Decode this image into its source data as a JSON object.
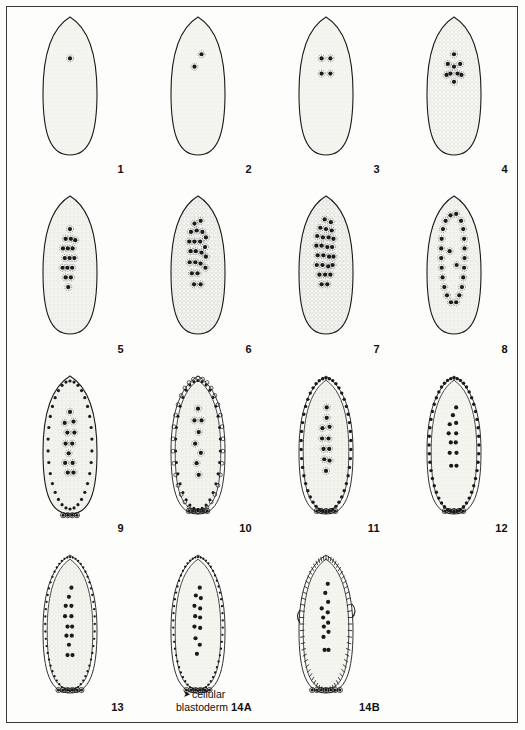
{
  "figure": {
    "type": "scientific-plate",
    "columns": 4,
    "rows": 4,
    "ink_color": "#1a1a1a",
    "cytoplasm_color": "#f7f7f2",
    "background_color": "#fdfdfb"
  },
  "annotation": {
    "arrow_glyph": "➤",
    "line1": "cellular",
    "line2": "blastoderm"
  },
  "panels": [
    {
      "label": "1",
      "stage": "zygote-one-nucleus",
      "nuclei": 1,
      "nuclei_points": [
        [
          0.5,
          0.3
        ]
      ],
      "periphery": "none",
      "pole_cells": 0,
      "membrane_style": "smooth",
      "stipple": "light",
      "halo": true
    },
    {
      "label": "2",
      "stage": "two-nuclei",
      "nuclei": 2,
      "nuclei_points": [
        [
          0.58,
          0.27
        ],
        [
          0.42,
          0.36
        ]
      ],
      "periphery": "none",
      "pole_cells": 0,
      "membrane_style": "smooth",
      "stipple": "light",
      "halo": true
    },
    {
      "label": "3",
      "stage": "four-nuclei",
      "nuclei": 4,
      "nuclei_points": [
        [
          0.4,
          0.3
        ],
        [
          0.6,
          0.3
        ],
        [
          0.4,
          0.41
        ],
        [
          0.6,
          0.41
        ]
      ],
      "periphery": "none",
      "pole_cells": 0,
      "membrane_style": "smooth",
      "stipple": "light",
      "halo": true
    },
    {
      "label": "4",
      "stage": "eight-nuclei-cluster",
      "nuclei": 9,
      "nuclei_points": [
        [
          0.5,
          0.27
        ],
        [
          0.36,
          0.34
        ],
        [
          0.64,
          0.34
        ],
        [
          0.5,
          0.36
        ],
        [
          0.33,
          0.42
        ],
        [
          0.42,
          0.41
        ],
        [
          0.58,
          0.41
        ],
        [
          0.67,
          0.42
        ],
        [
          0.5,
          0.47
        ]
      ],
      "periphery": "none",
      "pole_cells": 0,
      "membrane_style": "smooth",
      "stipple": "medium",
      "halo": true
    },
    {
      "label": "5",
      "stage": "syncytial-cleavage-central",
      "nuclei": 16,
      "nuclei_points": [
        [
          0.5,
          0.24
        ],
        [
          0.4,
          0.31
        ],
        [
          0.52,
          0.31
        ],
        [
          0.62,
          0.32
        ],
        [
          0.34,
          0.38
        ],
        [
          0.45,
          0.38
        ],
        [
          0.56,
          0.38
        ],
        [
          0.38,
          0.45
        ],
        [
          0.49,
          0.45
        ],
        [
          0.6,
          0.45
        ],
        [
          0.33,
          0.52
        ],
        [
          0.44,
          0.52
        ],
        [
          0.55,
          0.52
        ],
        [
          0.4,
          0.59
        ],
        [
          0.52,
          0.59
        ],
        [
          0.46,
          0.66
        ]
      ],
      "periphery": "none",
      "pole_cells": 0,
      "membrane_style": "smooth",
      "stipple": "medium",
      "halo": true
    },
    {
      "label": "6",
      "stage": "syncytial-cleavage-expanding",
      "nuclei": 22,
      "nuclei_points": [
        [
          0.42,
          0.2
        ],
        [
          0.56,
          0.18
        ],
        [
          0.34,
          0.26
        ],
        [
          0.47,
          0.25
        ],
        [
          0.6,
          0.26
        ],
        [
          0.68,
          0.3
        ],
        [
          0.3,
          0.33
        ],
        [
          0.42,
          0.33
        ],
        [
          0.55,
          0.33
        ],
        [
          0.66,
          0.37
        ],
        [
          0.33,
          0.4
        ],
        [
          0.45,
          0.4
        ],
        [
          0.58,
          0.41
        ],
        [
          0.68,
          0.44
        ],
        [
          0.31,
          0.48
        ],
        [
          0.44,
          0.48
        ],
        [
          0.56,
          0.49
        ],
        [
          0.67,
          0.52
        ],
        [
          0.36,
          0.56
        ],
        [
          0.49,
          0.56
        ],
        [
          0.41,
          0.64
        ],
        [
          0.56,
          0.64
        ]
      ],
      "periphery": "none",
      "pole_cells": 0,
      "membrane_style": "smooth",
      "stipple": "heavy",
      "halo": true
    },
    {
      "label": "7",
      "stage": "syncytial-cleavage-dense",
      "nuclei": 26,
      "nuclei_points": [
        [
          0.47,
          0.17
        ],
        [
          0.61,
          0.19
        ],
        [
          0.37,
          0.23
        ],
        [
          0.5,
          0.24
        ],
        [
          0.63,
          0.25
        ],
        [
          0.3,
          0.29
        ],
        [
          0.43,
          0.3
        ],
        [
          0.56,
          0.3
        ],
        [
          0.67,
          0.31
        ],
        [
          0.28,
          0.36
        ],
        [
          0.4,
          0.36
        ],
        [
          0.53,
          0.37
        ],
        [
          0.64,
          0.37
        ],
        [
          0.31,
          0.43
        ],
        [
          0.44,
          0.43
        ],
        [
          0.57,
          0.44
        ],
        [
          0.67,
          0.44
        ],
        [
          0.29,
          0.5
        ],
        [
          0.42,
          0.5
        ],
        [
          0.55,
          0.51
        ],
        [
          0.65,
          0.5
        ],
        [
          0.35,
          0.57
        ],
        [
          0.48,
          0.57
        ],
        [
          0.6,
          0.57
        ],
        [
          0.4,
          0.64
        ],
        [
          0.53,
          0.64
        ]
      ],
      "periphery": "none",
      "pole_cells": 0,
      "membrane_style": "smooth",
      "stipple": "heavy",
      "halo": true
    },
    {
      "label": "8",
      "stage": "nuclear-migration-to-cortex",
      "nuclei": 24,
      "nuclei_points": [
        [
          0.42,
          0.14
        ],
        [
          0.55,
          0.13
        ],
        [
          0.31,
          0.18
        ],
        [
          0.66,
          0.18
        ],
        [
          0.25,
          0.24
        ],
        [
          0.71,
          0.24
        ],
        [
          0.22,
          0.31
        ],
        [
          0.73,
          0.31
        ],
        [
          0.21,
          0.38
        ],
        [
          0.74,
          0.38
        ],
        [
          0.21,
          0.45
        ],
        [
          0.74,
          0.45
        ],
        [
          0.22,
          0.52
        ],
        [
          0.73,
          0.52
        ],
        [
          0.24,
          0.59
        ],
        [
          0.71,
          0.59
        ],
        [
          0.28,
          0.66
        ],
        [
          0.68,
          0.66
        ],
        [
          0.34,
          0.72
        ],
        [
          0.62,
          0.72
        ],
        [
          0.43,
          0.77
        ],
        [
          0.55,
          0.77
        ],
        [
          0.4,
          0.4
        ],
        [
          0.56,
          0.5
        ]
      ],
      "periphery": "none",
      "pole_cells": 0,
      "membrane_style": "smooth",
      "stipple": "medium",
      "halo": true
    },
    {
      "label": "9",
      "stage": "syncytial-blastoderm-pole-buds",
      "nuclei": 12,
      "nuclei_points": [
        [
          0.5,
          0.26
        ],
        [
          0.38,
          0.34
        ],
        [
          0.58,
          0.33
        ],
        [
          0.44,
          0.41
        ],
        [
          0.6,
          0.41
        ],
        [
          0.4,
          0.49
        ],
        [
          0.55,
          0.49
        ],
        [
          0.47,
          0.56
        ],
        [
          0.39,
          0.63
        ],
        [
          0.56,
          0.63
        ],
        [
          0.45,
          0.7
        ],
        [
          0.58,
          0.7
        ]
      ],
      "periphery": "dots-inner",
      "periphery_count": 34,
      "pole_cells": 4,
      "membrane_style": "smooth",
      "stipple": "medium",
      "halo": true
    },
    {
      "label": "10",
      "stage": "syncytial-blastoderm-scalloped",
      "nuclei": 8,
      "nuclei_points": [
        [
          0.5,
          0.22
        ],
        [
          0.4,
          0.31
        ],
        [
          0.6,
          0.31
        ],
        [
          0.52,
          0.4
        ],
        [
          0.42,
          0.49
        ],
        [
          0.58,
          0.56
        ],
        [
          0.46,
          0.64
        ],
        [
          0.52,
          0.73
        ]
      ],
      "periphery": "scallop",
      "periphery_count": 34,
      "pole_cells": 5,
      "membrane_style": "scalloped",
      "stipple": "medium",
      "halo": true
    },
    {
      "label": "11",
      "stage": "cortical-nuclei-dense-ring",
      "nuclei": 11,
      "nuclei_points": [
        [
          0.52,
          0.21
        ],
        [
          0.52,
          0.29
        ],
        [
          0.4,
          0.37
        ],
        [
          0.6,
          0.36
        ],
        [
          0.39,
          0.45
        ],
        [
          0.57,
          0.45
        ],
        [
          0.43,
          0.53
        ],
        [
          0.59,
          0.53
        ],
        [
          0.45,
          0.61
        ],
        [
          0.6,
          0.62
        ],
        [
          0.5,
          0.7
        ]
      ],
      "periphery": "dots-dense",
      "periphery_count": 46,
      "pole_cells": 5,
      "membrane_style": "beaded",
      "stipple": "medium",
      "halo": true
    },
    {
      "label": "12",
      "stage": "cortical-nuclei-ring-yolk-nuclei",
      "nuclei": 12,
      "nuclei_points": [
        [
          0.56,
          0.21
        ],
        [
          0.47,
          0.27
        ],
        [
          0.38,
          0.34
        ],
        [
          0.56,
          0.33
        ],
        [
          0.35,
          0.41
        ],
        [
          0.56,
          0.41
        ],
        [
          0.41,
          0.48
        ],
        [
          0.55,
          0.48
        ],
        [
          0.38,
          0.56
        ],
        [
          0.57,
          0.56
        ],
        [
          0.42,
          0.66
        ],
        [
          0.57,
          0.66
        ]
      ],
      "periphery": "dots-dense",
      "periphery_count": 48,
      "pole_cells": 5,
      "membrane_style": "beaded",
      "stipple": "light",
      "halo": false
    },
    {
      "label": "13",
      "stage": "pre-cellularisation",
      "nuclei": 13,
      "nuclei_points": [
        [
          0.54,
          0.22
        ],
        [
          0.47,
          0.29
        ],
        [
          0.38,
          0.36
        ],
        [
          0.54,
          0.36
        ],
        [
          0.36,
          0.44
        ],
        [
          0.54,
          0.44
        ],
        [
          0.43,
          0.52
        ],
        [
          0.56,
          0.52
        ],
        [
          0.4,
          0.59
        ],
        [
          0.55,
          0.59
        ],
        [
          0.47,
          0.66
        ],
        [
          0.43,
          0.74
        ],
        [
          0.57,
          0.74
        ]
      ],
      "periphery": "dots-fine",
      "periphery_count": 56,
      "pole_cells": 6,
      "membrane_style": "beaded",
      "stipple": "medium",
      "halo": false
    },
    {
      "label": "14A",
      "stage": "cellularisation-begins",
      "nuclei": 12,
      "nuclei_points": [
        [
          0.55,
          0.22
        ],
        [
          0.44,
          0.28
        ],
        [
          0.58,
          0.3
        ],
        [
          0.4,
          0.36
        ],
        [
          0.56,
          0.38
        ],
        [
          0.42,
          0.44
        ],
        [
          0.56,
          0.45
        ],
        [
          0.4,
          0.52
        ],
        [
          0.56,
          0.53
        ],
        [
          0.43,
          0.61
        ],
        [
          0.55,
          0.66
        ],
        [
          0.47,
          0.73
        ]
      ],
      "periphery": "dots-fine",
      "periphery_count": 58,
      "pole_cells": 6,
      "membrane_style": "beaded",
      "stipple": "light",
      "halo": false
    },
    {
      "label": "14B",
      "stage": "cellular-blastoderm-columnar",
      "nuclei": 12,
      "nuclei_points": [
        [
          0.55,
          0.19
        ],
        [
          0.48,
          0.26
        ],
        [
          0.56,
          0.33
        ],
        [
          0.38,
          0.38
        ],
        [
          0.55,
          0.41
        ],
        [
          0.42,
          0.45
        ],
        [
          0.56,
          0.49
        ],
        [
          0.44,
          0.52
        ],
        [
          0.57,
          0.56
        ],
        [
          0.43,
          0.6
        ],
        [
          0.46,
          0.7
        ],
        [
          0.57,
          0.7
        ]
      ],
      "periphery": "columnar",
      "periphery_count": 64,
      "pole_cells": 7,
      "membrane_style": "columnar",
      "stipple": "light",
      "halo": false,
      "gastrulation_furrow": true
    }
  ]
}
